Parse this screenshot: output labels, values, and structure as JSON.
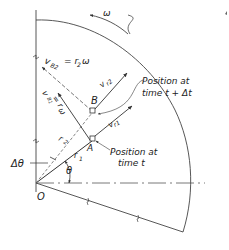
{
  "diagram": {
    "labels": {
      "omega": "ω",
      "vB2": "v_B2 = r₂ω",
      "vB2_main": "v",
      "vB2_sub": "B2",
      "vB2_rhs": "= r",
      "vB2_rhs_sub": "2",
      "vB2_omega": "ω",
      "vB1_main": "v",
      "vB1_sub": "B1",
      "vB1_rhs": "= r",
      "vB1_rhs_sub": "1",
      "vB1_omega": "ω",
      "vr2": "v",
      "vr2_sub": "r2",
      "vr1": "v",
      "vr1_sub": "r1",
      "point_B": "B",
      "point_A": "A",
      "r2": "r",
      "r2_sub": "2",
      "r1": "r",
      "r1_sub": "1",
      "delta_theta": "Δθ",
      "theta": "θ",
      "origin": "O",
      "pos_later_line1": "Position at",
      "pos_later_line2": "time t + Δt",
      "pos_now_line1": "Position at",
      "pos_now_line2": "time t"
    },
    "colors": {
      "line": "#333333",
      "text": "#222222",
      "background": "#ffffff"
    }
  }
}
